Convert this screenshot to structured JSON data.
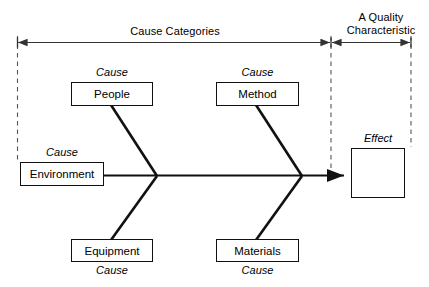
{
  "diagram": {
    "type": "fishbone-ishikawa-cause-and-effect-diagram",
    "brackets": [
      {
        "id": "cause-categories",
        "label": "Cause Categories"
      },
      {
        "id": "quality-characteristic",
        "label_line1": "A Quality",
        "label_line2": "Characteristic"
      }
    ],
    "cause_tag": "Cause",
    "effect_tag": "Effect",
    "categories": [
      {
        "id": "people",
        "label": "People",
        "position": "upper-left",
        "tag": "Cause",
        "tag_position": "above"
      },
      {
        "id": "method",
        "label": "Method",
        "position": "upper-right",
        "tag": "Cause",
        "tag_position": "above"
      },
      {
        "id": "environment",
        "label": "Environment",
        "position": "left-spine",
        "tag": "Cause",
        "tag_position": "above"
      },
      {
        "id": "equipment",
        "label": "Equipment",
        "position": "lower-left",
        "tag": "Cause",
        "tag_position": "below"
      },
      {
        "id": "materials",
        "label": "Materials",
        "position": "lower-right",
        "tag": "Cause",
        "tag_position": "below"
      }
    ],
    "effect": {
      "id": "effect",
      "label": "",
      "tag": "Effect"
    },
    "colors": {
      "line": "#111111",
      "bracket_line": "#333333",
      "dashed": "#555555",
      "background": "#ffffff",
      "text": "#000000"
    }
  }
}
